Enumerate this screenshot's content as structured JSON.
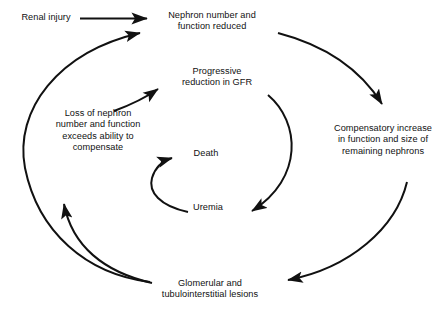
{
  "diagram": {
    "type": "cyclical-flow-diagram",
    "background_color": "#ffffff",
    "stroke_color": "#111111",
    "text_color": "#111111",
    "nodes": [
      {
        "id": "renal-injury",
        "label": "Renal injury"
      },
      {
        "id": "nephron-number",
        "label": "Nephron number and\nfunction reduced"
      },
      {
        "id": "progressive",
        "label": "Progressive\nreduction in GFR"
      },
      {
        "id": "loss",
        "label": "Loss of nephron\nnumber and function\nexceeds ability to\ncompensate"
      },
      {
        "id": "death",
        "label": "Death"
      },
      {
        "id": "uremia",
        "label": "Uremia"
      },
      {
        "id": "compensatory",
        "label": "Compensatory increase\nin function and size of\nremaining nephrons"
      },
      {
        "id": "glomerular",
        "label": "Glomerular and\ntubulointerstitial lesions"
      }
    ],
    "edges": [
      {
        "id": "edge-renal-to-nephron",
        "from": "renal-injury",
        "to": "nephron-number",
        "style": "straight"
      },
      {
        "id": "edge-nephron-to-compensatory",
        "from": "nephron-number",
        "to": "compensatory",
        "style": "curved"
      },
      {
        "id": "edge-compensatory-to-glomerular",
        "from": "compensatory",
        "to": "glomerular",
        "style": "curved"
      },
      {
        "id": "edge-glomerular-to-nephron",
        "from": "glomerular",
        "to": "nephron-number",
        "style": "curved"
      },
      {
        "id": "edge-glomerular-to-loss",
        "from": "glomerular",
        "to": "loss",
        "style": "curved"
      },
      {
        "id": "edge-loss-to-progressive",
        "from": "loss",
        "to": "progressive",
        "style": "curved"
      },
      {
        "id": "edge-progressive-to-uremia",
        "from": "progressive",
        "to": "uremia",
        "style": "curved"
      },
      {
        "id": "edge-uremia-to-death",
        "from": "uremia",
        "to": "death",
        "style": "curved"
      }
    ]
  }
}
